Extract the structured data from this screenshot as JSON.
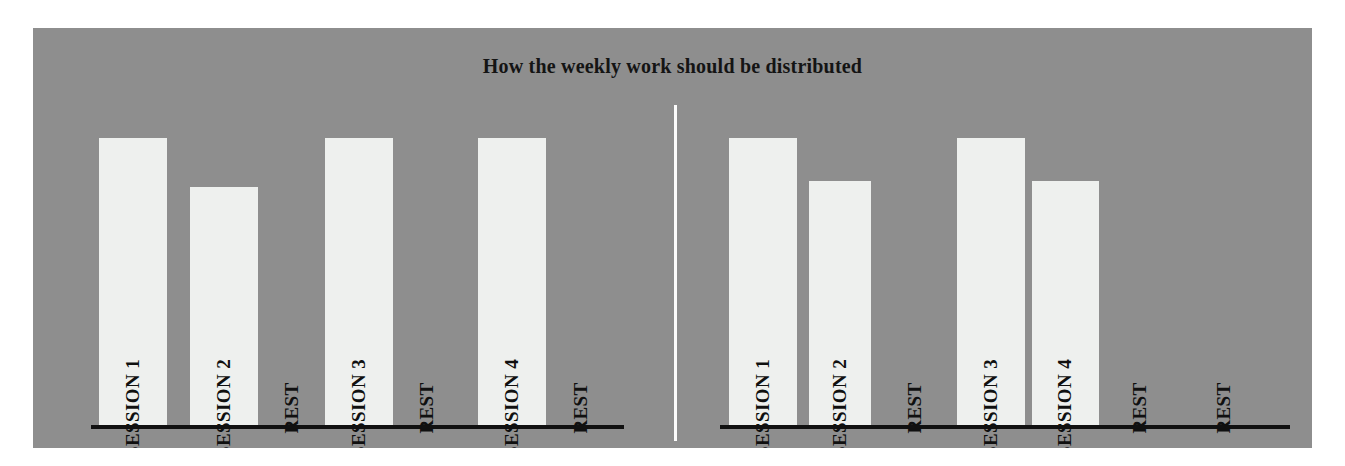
{
  "chart": {
    "title": "How the weekly work should be distributed",
    "background_color": "#8e8e8e",
    "bar_color": "#eef0ee",
    "axis_color": "#111111",
    "divider_color": "#fcfcfc"
  },
  "chart_data": {
    "type": "bar",
    "title": "How the weekly work should be distributed",
    "xlabel": "",
    "ylabel": "",
    "grid": false,
    "legend": "none",
    "ylim": [
      0,
      100
    ],
    "panels": [
      {
        "name": "Left schedule",
        "categories": [
          "SESSION 1",
          "SESSION 2",
          "REST",
          "SESSION 3",
          "REST",
          "SESSION 4",
          "REST"
        ],
        "values": [
          100,
          83,
          0,
          100,
          0,
          100,
          0
        ]
      },
      {
        "name": "Right schedule",
        "categories": [
          "SESSION 1",
          "SESSION 2",
          "REST",
          "SESSION 3",
          "SESSION 4",
          "REST",
          "REST"
        ],
        "values": [
          100,
          85,
          0,
          100,
          85,
          0,
          0
        ]
      }
    ]
  },
  "panels": [
    {
      "id": "left",
      "slots": [
        {
          "label": "SESSION 1",
          "is_bar": true,
          "value": 100
        },
        {
          "label": "SESSION 2",
          "is_bar": true,
          "value": 83
        },
        {
          "label": "REST",
          "is_bar": false,
          "value": 0
        },
        {
          "label": "SESSION 3",
          "is_bar": true,
          "value": 100
        },
        {
          "label": "REST",
          "is_bar": false,
          "value": 0
        },
        {
          "label": "SESSION 4",
          "is_bar": true,
          "value": 100
        },
        {
          "label": "REST",
          "is_bar": false,
          "value": 0
        }
      ]
    },
    {
      "id": "right",
      "slots": [
        {
          "label": "SESSION 1",
          "is_bar": true,
          "value": 100
        },
        {
          "label": "SESSION 2",
          "is_bar": true,
          "value": 85
        },
        {
          "label": "REST",
          "is_bar": false,
          "value": 0
        },
        {
          "label": "SESSION 3",
          "is_bar": true,
          "value": 100
        },
        {
          "label": "SESSION 4",
          "is_bar": true,
          "value": 85
        },
        {
          "label": "REST",
          "is_bar": false,
          "value": 0
        },
        {
          "label": "REST",
          "is_bar": false,
          "value": 0
        }
      ]
    }
  ]
}
